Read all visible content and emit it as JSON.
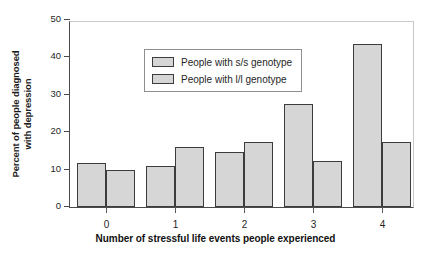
{
  "chart_data": {
    "type": "bar",
    "title": "",
    "xlabel": "Number of stressful life events people experienced",
    "ylabel": "Percent of people diagnosed with depression",
    "ylabel_line1": "Percent of people diagnosed",
    "ylabel_line2": "with depression",
    "categories": [
      "0",
      "1",
      "2",
      "3",
      "4"
    ],
    "yticks": [
      "0",
      "10",
      "20",
      "30",
      "40",
      "50"
    ],
    "ylim": [
      0,
      50
    ],
    "grid": false,
    "legend_position": "upper-left inside plot",
    "series": [
      {
        "name": "People with s/s genotype",
        "values": [
          11.8,
          10.9,
          14.7,
          27.5,
          43.7
        ],
        "color": "#d6d6d6",
        "edge_color": "#3c3c3c"
      },
      {
        "name": "People with l/l genotype",
        "values": [
          9.9,
          16.0,
          17.3,
          12.4,
          17.3
        ],
        "color": "#d6d6d6",
        "edge_color": "#3c3c3c"
      }
    ]
  },
  "legend": {
    "items": [
      {
        "label": "People with s/s genotype"
      },
      {
        "label": "People with l/l genotype"
      }
    ]
  },
  "colors": {
    "bar_fill": "#d6d6d6",
    "bar_edge": "#3c3c3c",
    "axis": "#4a4a4a",
    "frame_light": "#c9c9c9",
    "text": "#1a1a1a",
    "background": "#ffffff"
  }
}
